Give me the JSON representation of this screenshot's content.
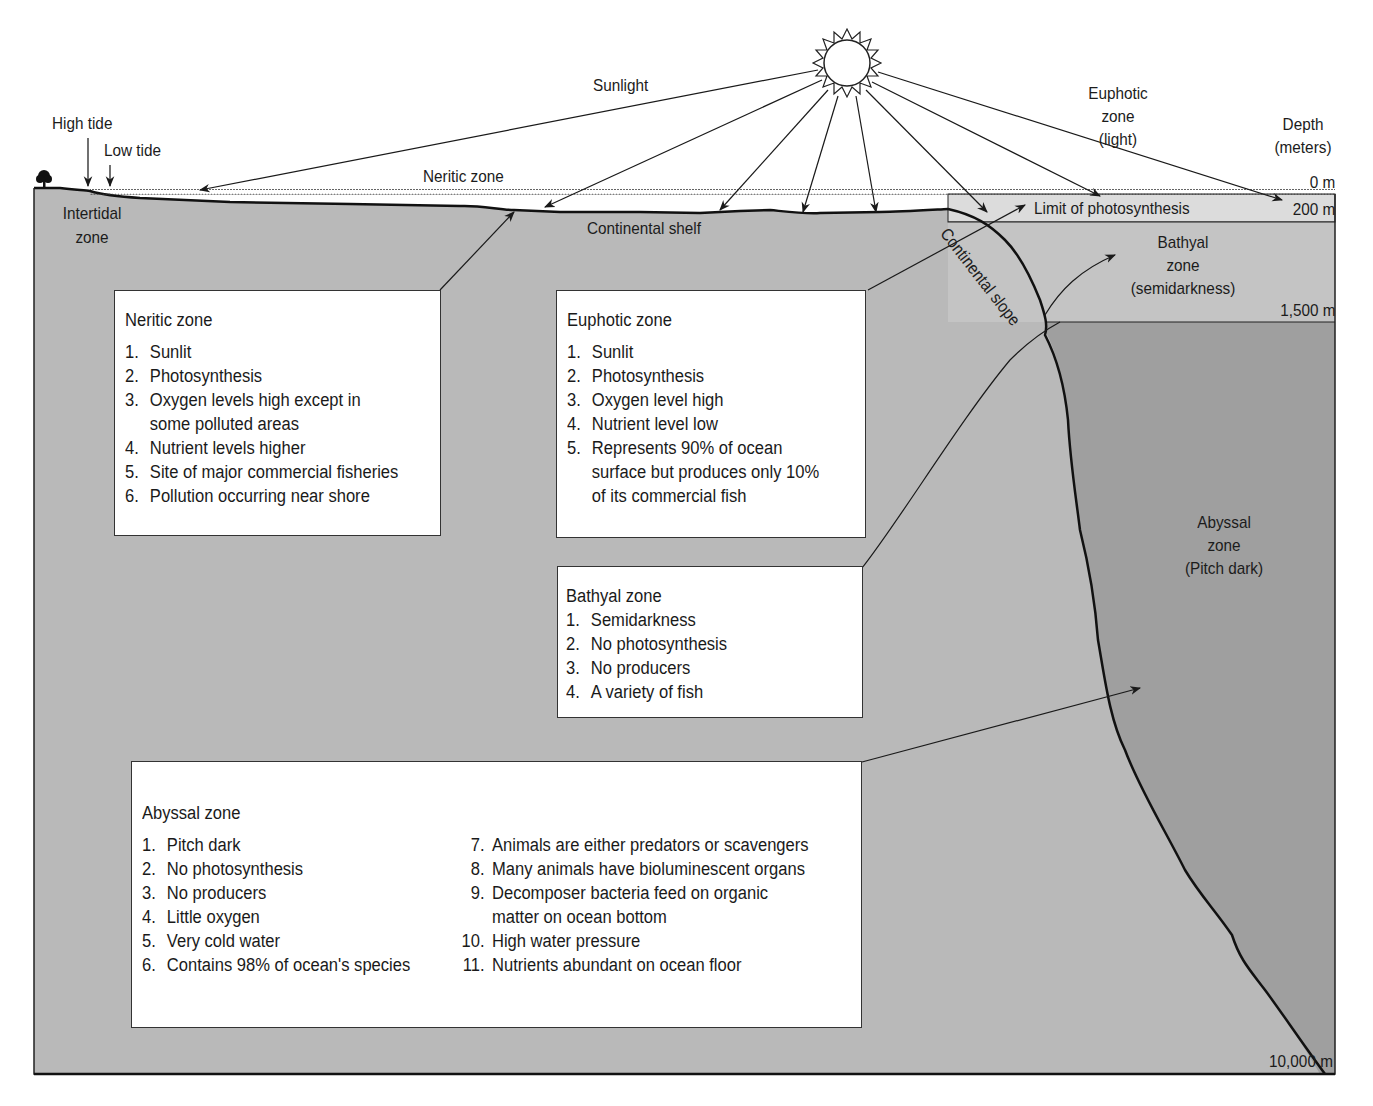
{
  "diagram": {
    "colors": {
      "background": "#ffffff",
      "shelf_fill": "#b9b9b9",
      "bathyal_fill": "#c4c4c4",
      "euphotic_band": "#dcdcdc",
      "abyssal_fill": "#9f9f9f",
      "outline": "#1a1a1a"
    },
    "top_labels": {
      "sunlight": "Sunlight",
      "high_tide": "High tide",
      "low_tide": "Low tide",
      "neritic_zone": "Neritic zone",
      "euphotic_l1": "Euphotic",
      "euphotic_l2": "zone",
      "euphotic_l3": "(light)",
      "depth_l1": "Depth",
      "depth_l2": "(meters)"
    },
    "depth_marks": {
      "d0": "0 m",
      "d200": "200 m",
      "d1500": "1,500 m",
      "d10000": "10,000 m"
    },
    "region_labels": {
      "intertidal_l1": "Intertidal",
      "intertidal_l2": "zone",
      "continental_shelf": "Continental shelf",
      "limit_photosynthesis": "Limit of photosynthesis",
      "continental_slope": "Continental slope",
      "bathyal_l1": "Bathyal",
      "bathyal_l2": "zone",
      "bathyal_l3": "(semidarkness)",
      "abyssal_l1": "Abyssal",
      "abyssal_l2": "zone",
      "abyssal_l3": "(Pitch dark)"
    },
    "boxes": {
      "neritic": {
        "title": "Neritic zone",
        "items": [
          {
            "n": "1.",
            "t": "Sunlit"
          },
          {
            "n": "2.",
            "t": "Photosynthesis"
          },
          {
            "n": "3.",
            "t": "Oxygen levels high except in"
          },
          {
            "n": "",
            "t": "some polluted areas"
          },
          {
            "n": "4.",
            "t": "Nutrient levels higher"
          },
          {
            "n": "5.",
            "t": "Site of major commercial fisheries"
          },
          {
            "n": "6.",
            "t": "Pollution occurring near shore"
          }
        ]
      },
      "euphotic": {
        "title": "Euphotic zone",
        "items": [
          {
            "n": "1.",
            "t": "Sunlit"
          },
          {
            "n": "2.",
            "t": "Photosynthesis"
          },
          {
            "n": "3.",
            "t": "Oxygen level high"
          },
          {
            "n": "4.",
            "t": "Nutrient level low"
          },
          {
            "n": "5.",
            "t": "Represents 90% of ocean"
          },
          {
            "n": "",
            "t": "surface but produces only 10%"
          },
          {
            "n": "",
            "t": "of its commercial fish"
          }
        ]
      },
      "bathyal": {
        "title": "Bathyal zone",
        "items": [
          {
            "n": "1.",
            "t": "Semidarkness"
          },
          {
            "n": "2.",
            "t": "No photosynthesis"
          },
          {
            "n": "3.",
            "t": "No producers"
          },
          {
            "n": "4.",
            "t": "A variety of fish"
          }
        ]
      },
      "abyssal": {
        "title": "Abyssal zone",
        "left_items": [
          {
            "n": "1.",
            "t": "Pitch dark"
          },
          {
            "n": "2.",
            "t": "No photosynthesis"
          },
          {
            "n": "3.",
            "t": "No producers"
          },
          {
            "n": "4.",
            "t": "Little oxygen"
          },
          {
            "n": "5.",
            "t": "Very cold water"
          },
          {
            "n": "6.",
            "t": "Contains 98% of ocean's species"
          }
        ],
        "right_items": [
          {
            "n": "7.",
            "t": "Animals are either predators or scavengers"
          },
          {
            "n": "8.",
            "t": "Many animals have bioluminescent organs"
          },
          {
            "n": "9.",
            "t": "Decomposer bacteria feed on organic"
          },
          {
            "n": "",
            "t": "matter on ocean bottom"
          },
          {
            "n": "10.",
            "t": "High water pressure"
          },
          {
            "n": "11.",
            "t": "Nutrients abundant on ocean floor"
          }
        ]
      }
    }
  }
}
